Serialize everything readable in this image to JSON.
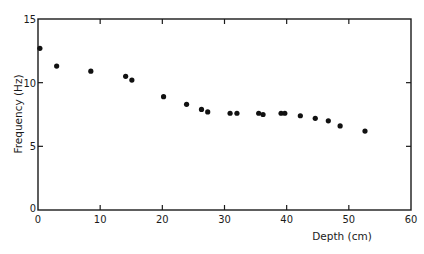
{
  "chart_data": {
    "type": "scatter",
    "title": "",
    "xlabel": "Depth  (cm)",
    "ylabel": "Frequency  (Hz)",
    "xlim": [
      0,
      60
    ],
    "ylim": [
      0,
      15
    ],
    "xticks": [
      0,
      10,
      20,
      30,
      40,
      50,
      60
    ],
    "yticks": [
      0,
      5,
      10,
      15
    ],
    "xtick_labels": [
      "0",
      "10",
      "20",
      "30",
      "40",
      "50",
      "60"
    ],
    "ytick_labels": [
      "0",
      "5",
      "10",
      "15"
    ],
    "grid": false,
    "legend": null,
    "series": [
      {
        "name": "measurements",
        "x": [
          0.3,
          3.0,
          8.5,
          14.1,
          15.1,
          20.2,
          23.9,
          26.3,
          27.3,
          30.9,
          32.0,
          35.5,
          36.2,
          39.1,
          39.7,
          42.2,
          44.6,
          46.7,
          48.6,
          52.6
        ],
        "y": [
          12.7,
          11.3,
          10.9,
          10.5,
          10.2,
          8.9,
          8.3,
          7.9,
          7.7,
          7.6,
          7.6,
          7.6,
          7.5,
          7.6,
          7.6,
          7.4,
          7.2,
          7.0,
          6.6,
          6.2
        ]
      }
    ]
  }
}
